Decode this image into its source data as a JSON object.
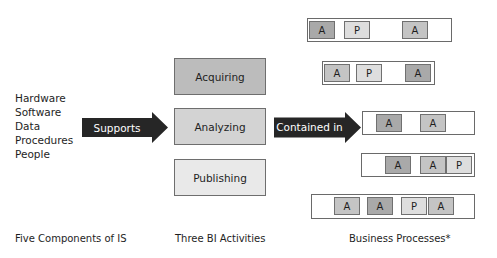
{
  "components": {
    "items": [
      "Hardware",
      "Software",
      "Data",
      "Procedures",
      "People"
    ]
  },
  "arrows": {
    "supports": {
      "label": "Supports",
      "color": "#262626"
    },
    "contained_in": {
      "label": "Contained in",
      "color": "#262626"
    }
  },
  "activities": [
    {
      "label": "Acquiring",
      "fill": "#bcbcbc"
    },
    {
      "label": "Analyzing",
      "fill": "#d3d3d3"
    },
    {
      "label": "Publishing",
      "fill": "#e9e9e9"
    }
  ],
  "process_fills": {
    "A_dark": "#a9a9a9",
    "A_mid": "#c4c4c4",
    "P_light": "#dedede"
  },
  "processes": [
    {
      "activities": [
        {
          "label": "A",
          "shade": "A_dark"
        },
        {
          "label": "P",
          "shade": "P_light"
        },
        {
          "label": "A",
          "shade": "A_mid"
        }
      ]
    },
    {
      "activities": [
        {
          "label": "A",
          "shade": "A_mid"
        },
        {
          "label": "P",
          "shade": "P_light"
        },
        {
          "label": "A",
          "shade": "A_dark"
        }
      ]
    },
    {
      "activities": [
        {
          "label": "A",
          "shade": "A_dark"
        },
        {
          "label": "A",
          "shade": "A_mid"
        }
      ]
    },
    {
      "activities": [
        {
          "label": "A",
          "shade": "A_dark"
        },
        {
          "label": "A",
          "shade": "A_mid"
        },
        {
          "label": "P",
          "shade": "P_light"
        }
      ]
    },
    {
      "activities": [
        {
          "label": "A",
          "shade": "A_mid"
        },
        {
          "label": "A",
          "shade": "A_dark"
        },
        {
          "label": "P",
          "shade": "P_light"
        },
        {
          "label": "A",
          "shade": "A_mid"
        }
      ]
    }
  ],
  "captions": {
    "components": "Five Components of IS",
    "activities": "Three BI Activities",
    "processes": "Business Processes*"
  }
}
